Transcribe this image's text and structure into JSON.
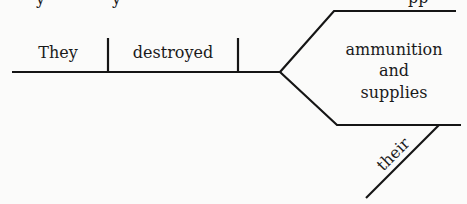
{
  "diagram": {
    "type": "sentence-diagram",
    "subject": "They",
    "verb": "destroyed",
    "compound_object": {
      "line1": "ammunition",
      "conjunction": "and",
      "line3": "supplies"
    },
    "modifier": "their",
    "colors": {
      "ink": "#151515",
      "paper": "#fbfbfa"
    }
  },
  "cropped_previous_line": {
    "fragment_left": "y",
    "fragment_mid": "y",
    "fragment_right": "pp"
  }
}
